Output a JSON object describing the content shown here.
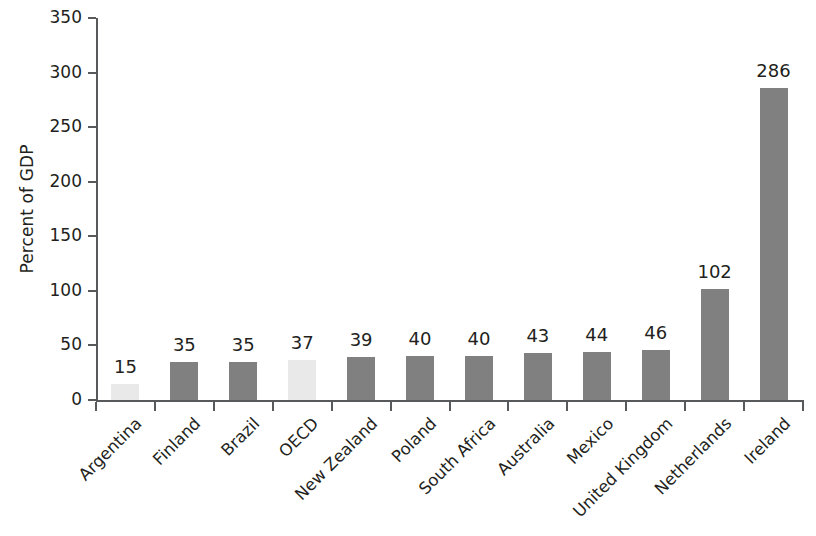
{
  "chart_data": {
    "type": "bar",
    "title": "",
    "subtitle": "",
    "xlabel": "",
    "ylabel": "Percent of GDP",
    "ylim": [
      0,
      350
    ],
    "y_ticks": [
      0,
      50,
      100,
      150,
      200,
      250,
      300,
      350
    ],
    "grid": false,
    "legend": false,
    "value_labels": true,
    "categories": [
      "Argentina",
      "Finland",
      "Brazil",
      "OECD",
      "New Zealand",
      "Poland",
      "South Africa",
      "Australia",
      "Mexico",
      "United Kingdom",
      "Netherlands",
      "Ireland"
    ],
    "values": [
      15,
      35,
      35,
      37,
      39,
      40,
      40,
      43,
      44,
      46,
      102,
      286
    ],
    "value_label_text": [
      "15",
      "35",
      "35",
      "37",
      "39",
      "40",
      "40",
      "43",
      "44",
      "46",
      "102",
      "286"
    ],
    "bar_styles": [
      "faint",
      "solid",
      "solid",
      "faint",
      "solid",
      "solid",
      "solid",
      "solid",
      "solid",
      "solid",
      "solid",
      "solid"
    ],
    "colors": {
      "bar_solid": "#808080",
      "bar_faint": "#e9e9e9",
      "axis": "#58595b",
      "text": "#231f20",
      "background": "#ffffff"
    }
  }
}
